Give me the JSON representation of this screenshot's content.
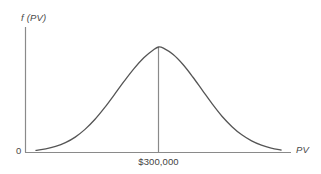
{
  "figure": {
    "background_color": "#ffffff",
    "width": 321,
    "height": 174
  },
  "labels": {
    "y_axis": "f (PV)",
    "x_axis": "PV",
    "origin": "0",
    "mean_tick": "$300,000"
  },
  "colors": {
    "curve": "#555555",
    "axis": "#8a8a8a",
    "mean_line": "#8a8a8a",
    "text": "#4a4a4a"
  },
  "chart_data": {
    "type": "line",
    "title": "",
    "xlabel": "PV",
    "ylabel": "f (PV)",
    "grid": false,
    "legend": null,
    "annotations": [
      {
        "label": "$300,000",
        "x": 300000,
        "kind": "mean-vertical-line",
        "description": "Vertical line dropped from the peak of the density curve to the horizontal axis, labelled $300,000"
      }
    ],
    "axis_ticks": {
      "x": [
        "0",
        "$300,000"
      ],
      "y": [
        "0"
      ]
    },
    "xlim": [
      0,
      1
    ],
    "ylim": [
      0,
      1
    ],
    "series": [
      {
        "name": "f (PV)",
        "description": "Symmetric normal (bell-shaped) probability density curve peaking at $300,000",
        "x": [
          0.0,
          0.04,
          0.08,
          0.12,
          0.16,
          0.2,
          0.24,
          0.28,
          0.32,
          0.36,
          0.4,
          0.44,
          0.48,
          0.5,
          0.52,
          0.56,
          0.6,
          0.64,
          0.68,
          0.72,
          0.76,
          0.8,
          0.84,
          0.88,
          0.92,
          0.96,
          1.0
        ],
        "y": [
          0.018,
          0.03,
          0.051,
          0.083,
          0.13,
          0.195,
          0.278,
          0.378,
          0.489,
          0.602,
          0.708,
          0.8,
          0.867,
          0.89,
          0.88,
          0.826,
          0.742,
          0.637,
          0.522,
          0.408,
          0.304,
          0.218,
          0.149,
          0.098,
          0.062,
          0.037,
          0.021
        ]
      }
    ]
  }
}
